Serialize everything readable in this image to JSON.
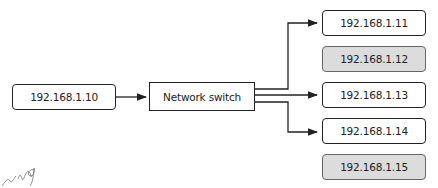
{
  "source": {
    "label": "192.168.1.10"
  },
  "switch": {
    "label": "Network switch"
  },
  "hosts": [
    {
      "label": "192.168.1.11",
      "connected": true,
      "highlight": false
    },
    {
      "label": "192.168.1.12",
      "connected": false,
      "highlight": true
    },
    {
      "label": "192.168.1.13",
      "connected": true,
      "highlight": false
    },
    {
      "label": "192.168.1.14",
      "connected": true,
      "highlight": false
    },
    {
      "label": "192.168.1.15",
      "connected": false,
      "highlight": true
    }
  ],
  "annotation": {
    "handwritten": "ing"
  },
  "colors": {
    "line": "#222222",
    "highlight_fill": "#dcdcdc",
    "highlight_border": "#666666"
  }
}
